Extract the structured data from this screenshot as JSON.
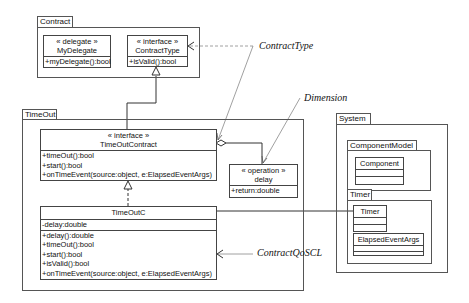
{
  "packages": {
    "contract": {
      "label": "Contract"
    },
    "timeout": {
      "label": "TimeOut"
    },
    "system": {
      "label": "System"
    },
    "component_model": {
      "label": "ComponentModel"
    },
    "timer": {
      "label": "Timer"
    }
  },
  "classes": {
    "my_delegate": {
      "stereotype": "« delegate »",
      "name": "MyDelegate",
      "operations": [
        "+myDelegate():bool"
      ]
    },
    "contract_type": {
      "stereotype": "« interface »",
      "name": "ContractType",
      "operations": [
        "+isValid():bool"
      ]
    },
    "timeout_contract": {
      "stereotype": "« interface »",
      "name": "TimeOutContract",
      "operations": [
        "+timeOut():bool",
        "+start():bool",
        "+onTimeEvent(source:object, e:ElapsedEventArgs)"
      ]
    },
    "delay": {
      "stereotype": "« operation »",
      "name": "delay",
      "operations": [
        "+return:double"
      ]
    },
    "timeoutc": {
      "name": "TimeOutC",
      "attributes": [
        "-delay:double"
      ],
      "operations": [
        "+delay():double",
        "+timeOut():bool",
        "+start():bool",
        "+isValid():bool",
        "+onTimeEvent(source:object, e:ElapsedEventArgs)"
      ]
    },
    "component": {
      "name": "Component"
    },
    "timer": {
      "name": "Timer"
    },
    "elapsed_event_args": {
      "name": "ElapsedEventArgs"
    }
  },
  "annotations": {
    "contract_type": "ContractType",
    "dimension": "Dimension",
    "contract_qoscl": "ContractQoSCL"
  }
}
